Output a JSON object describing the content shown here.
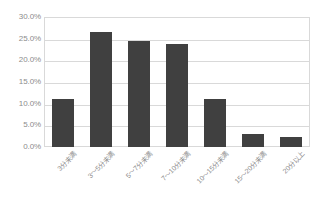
{
  "chart_data": {
    "type": "bar",
    "title": "",
    "subtitle": "",
    "xlabel": "",
    "ylabel": "",
    "categories": [
      "3分未満",
      "3～5分未満",
      "5～7分未満",
      "7～10分未満",
      "10～15分未満",
      "15～20分未満",
      "20分以上"
    ],
    "values": [
      11.0,
      26.6,
      24.4,
      23.7,
      11.0,
      3.0,
      2.4
    ],
    "value_unit": "%",
    "ylim": [
      0,
      30
    ],
    "ytick_labels": [
      "30.0%",
      "25.0%",
      "20.0%",
      "15.0%",
      "10.0%",
      "5.0%",
      "0.0%"
    ],
    "ytick_values": [
      30,
      25,
      20,
      15,
      10,
      5,
      0
    ],
    "grid": true,
    "legend": false,
    "legend_position": "none",
    "bar_color": "#404040",
    "gridline_color": "#d9d9d9",
    "axis_text_color": "#8c8c8c",
    "background_color": "#ffffff"
  }
}
